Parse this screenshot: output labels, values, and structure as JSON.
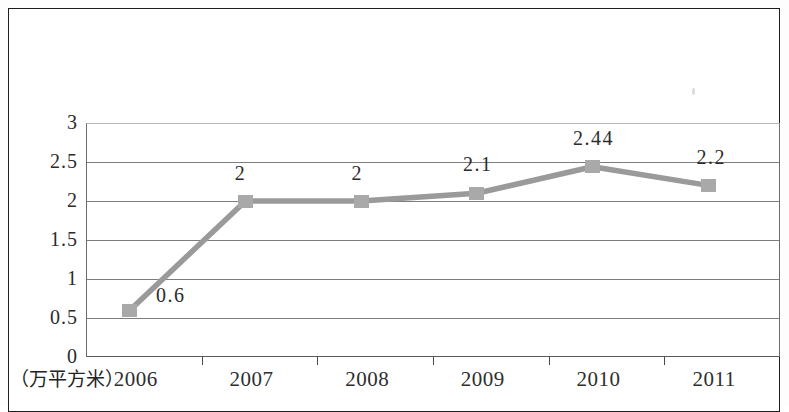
{
  "page": {
    "background_color": "#ffffff",
    "frame_color": "#1e1e1e"
  },
  "unit_label": "（万平方米）",
  "chart_data": {
    "type": "line",
    "title": "",
    "subtitle": "",
    "xlabel": "",
    "ylabel": "",
    "unit": "万平方米",
    "categories": [
      "2006",
      "2007",
      "2008",
      "2009",
      "2010",
      "2011"
    ],
    "values": [
      0.6,
      2,
      2,
      2.1,
      2.44,
      2.2
    ],
    "data_labels": [
      "0.6",
      "2",
      "2",
      "2.1",
      "2.44",
      "2.2"
    ],
    "ylim": [
      0,
      3
    ],
    "ytick_values": [
      0,
      0.5,
      1,
      1.5,
      2,
      2.5,
      3
    ],
    "ytick_labels": [
      "0",
      "0.5",
      "1",
      "1.5",
      "2",
      "2.5",
      "3"
    ],
    "grid": true,
    "grid_axis": "y",
    "legend": false,
    "legend_position": "none",
    "series": [
      {
        "name": "",
        "values": [
          0.6,
          2,
          2,
          2.1,
          2.44,
          2.2
        ],
        "line_color": "#9a9a9a",
        "marker_color": "#a9a9a9",
        "marker_shape": "square"
      }
    ],
    "colors": {
      "line": "#9a9a9a",
      "marker": "#a9a9a9",
      "gridline": "#7d7d7d",
      "axis": "#5a5a5a",
      "text": "#2b2b2b"
    }
  }
}
